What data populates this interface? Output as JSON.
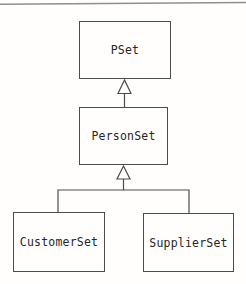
{
  "diagram": {
    "type": "uml-class-inheritance",
    "nodes": [
      {
        "id": "pset",
        "label": "PSet"
      },
      {
        "id": "personset",
        "label": "PersonSet"
      },
      {
        "id": "customerset",
        "label": "CustomerSet"
      },
      {
        "id": "supplierset",
        "label": "SupplierSet"
      }
    ],
    "edges": [
      {
        "from": "PersonSet",
        "to": "PSet",
        "type": "generalization"
      },
      {
        "from": "CustomerSet",
        "to": "PersonSet",
        "type": "generalization"
      },
      {
        "from": "SupplierSet",
        "to": "PersonSet",
        "type": "generalization"
      }
    ],
    "colors": {
      "line": "#4c4c4c",
      "text": "#262626",
      "top_rule": "#8f8f8f",
      "background": "#fffefd"
    }
  }
}
